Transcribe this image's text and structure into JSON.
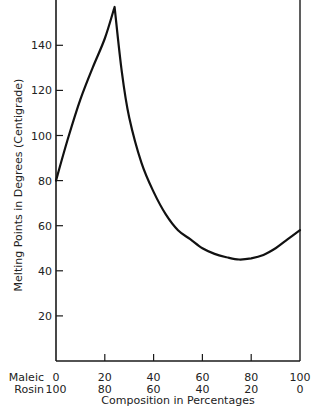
{
  "chart_data": {
    "type": "line",
    "title": "",
    "xlabel": "Composition in Percentages",
    "ylabel": "Melting Points in Degrees (Centigrade)",
    "x_rows": [
      {
        "label": "Maleic",
        "ticks": [
          "0",
          "20",
          "40",
          "60",
          "80",
          "100"
        ]
      },
      {
        "label": "Rosin",
        "ticks": [
          "100",
          "80",
          "60",
          "40",
          "20",
          "0"
        ]
      }
    ],
    "xlim": [
      0,
      100
    ],
    "ylim": [
      0,
      160
    ],
    "y_ticks": [
      20,
      40,
      60,
      80,
      100,
      120,
      140
    ],
    "grid": false,
    "legend": null,
    "series": [
      {
        "name": "Melting point",
        "x": [
          0,
          5,
          10,
          15,
          20,
          24,
          27,
          30,
          35,
          40,
          45,
          50,
          55,
          60,
          65,
          70,
          75,
          80,
          85,
          90,
          95,
          100
        ],
        "y": [
          80,
          99,
          116,
          130,
          143,
          157,
          128,
          108,
          88,
          75,
          65,
          58,
          54,
          50,
          47.5,
          46,
          45,
          45.5,
          47,
          50,
          54,
          58
        ]
      }
    ],
    "annotations": []
  }
}
